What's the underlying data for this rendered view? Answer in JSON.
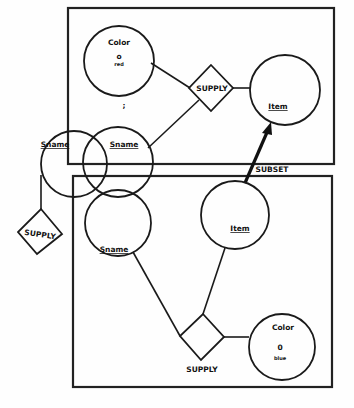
{
  "diagram": {
    "top_box": {
      "color_entity": {
        "label": "Color",
        "value": "o",
        "sub": "red"
      },
      "supply_relation": {
        "label": "SUPPLY"
      },
      "item_entity": {
        "label": "Item"
      },
      "sname_entity": {
        "label": "Sname"
      },
      "mark": {
        "label": ";"
      }
    },
    "bottom_box": {
      "item_entity": {
        "label": "Item"
      },
      "sname_entity": {
        "label": "Sname"
      },
      "supply_relation": {
        "label": "SUPPLY"
      },
      "color_entity": {
        "label": "Color",
        "value": "0",
        "sub": "blue"
      }
    },
    "outside": {
      "sname_entity": {
        "label": "Sname"
      },
      "supply_relation": {
        "label": "SUPPLY"
      }
    },
    "subset_link": {
      "label": "SUBSET"
    }
  }
}
